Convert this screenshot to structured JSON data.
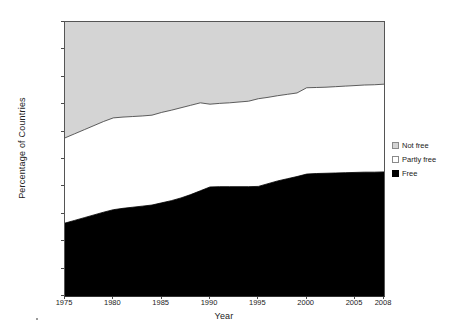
{
  "chart_data": {
    "type": "area",
    "stacked": true,
    "title": "",
    "xlabel": "Year",
    "ylabel": "Percentage of Countries",
    "x": [
      1975,
      1976,
      1977,
      1978,
      1979,
      1980,
      1981,
      1982,
      1983,
      1984,
      1985,
      1986,
      1987,
      1988,
      1989,
      1990,
      1991,
      1992,
      1993,
      1994,
      1995,
      1996,
      1997,
      1998,
      1999,
      2000,
      2001,
      2002,
      2003,
      2004,
      2005,
      2006,
      2007,
      2008
    ],
    "xlim": [
      1975,
      2008
    ],
    "ylim": [
      0,
      100
    ],
    "xticks": [
      1975,
      1980,
      1985,
      1990,
      1995,
      2000,
      2005,
      2008
    ],
    "xtick_labels": [
      "1975",
      "1980",
      "1985",
      "1990",
      "1995",
      "2000",
      "2005",
      "2008"
    ],
    "yticks": [
      0,
      10,
      20,
      30,
      40,
      50,
      60,
      70,
      80,
      90,
      100
    ],
    "ytick_labels": [
      "0%",
      "10%",
      "20%",
      "30%",
      "40%",
      "50%",
      "60%",
      "70%",
      "80%",
      "90%",
      "100%"
    ],
    "grid": false,
    "legend_position": "right",
    "series": [
      {
        "name": "Free",
        "color": "#000000",
        "values": [
          26.6,
          27.6,
          28.6,
          29.6,
          30.6,
          31.5,
          32.0,
          32.4,
          32.8,
          33.2,
          34.0,
          34.8,
          35.8,
          37.0,
          38.4,
          39.8,
          39.9,
          39.9,
          39.9,
          39.9,
          40.0,
          41.0,
          42.0,
          42.8,
          43.6,
          44.5,
          44.7,
          44.8,
          44.9,
          45.0,
          45.1,
          45.2,
          45.2,
          45.3
        ]
      },
      {
        "name": "Partly free",
        "color": "#ffffff",
        "values": [
          31.1,
          31.6,
          32.1,
          32.6,
          33.1,
          33.5,
          33.3,
          33.1,
          32.9,
          32.8,
          33.0,
          33.0,
          32.9,
          32.6,
          32.1,
          30.2,
          30.4,
          30.6,
          30.9,
          31.2,
          32.0,
          31.5,
          31.1,
          30.8,
          30.5,
          31.5,
          31.4,
          31.4,
          31.5,
          31.6,
          31.7,
          31.8,
          31.9,
          32.0
        ]
      },
      {
        "name": "Not free",
        "color": "#d4d4d4",
        "values": [
          42.3,
          40.8,
          39.3,
          37.8,
          36.3,
          35.0,
          34.7,
          34.5,
          34.3,
          34.0,
          33.0,
          32.2,
          31.3,
          30.4,
          29.5,
          30.0,
          29.7,
          29.5,
          29.2,
          28.9,
          28.0,
          27.5,
          26.9,
          26.4,
          25.9,
          24.0,
          23.9,
          23.8,
          23.6,
          23.4,
          23.2,
          23.0,
          22.9,
          22.7
        ]
      }
    ],
    "cumulative_upper": {
      "free": [
        26.6,
        27.6,
        28.6,
        29.6,
        30.6,
        31.5,
        32.0,
        32.4,
        32.8,
        33.2,
        34.0,
        34.8,
        35.8,
        37.0,
        38.4,
        39.8,
        39.9,
        39.9,
        39.9,
        39.9,
        40.0,
        41.0,
        42.0,
        42.8,
        43.6,
        44.5,
        44.7,
        44.8,
        44.9,
        45.0,
        45.1,
        45.2,
        45.2,
        45.3
      ],
      "free_plus_partly": [
        57.7,
        59.2,
        60.7,
        62.2,
        63.7,
        65.0,
        65.3,
        65.5,
        65.7,
        66.0,
        67.0,
        67.8,
        68.7,
        69.6,
        70.5,
        70.0,
        70.3,
        70.5,
        70.8,
        71.1,
        72.0,
        72.5,
        73.1,
        73.6,
        74.1,
        76.0,
        76.1,
        76.2,
        76.4,
        76.6,
        76.8,
        77.0,
        77.1,
        77.3
      ]
    },
    "legend_entries": [
      {
        "label": "Not free",
        "swatch": "light-gray"
      },
      {
        "label": "Partly free",
        "swatch": "white"
      },
      {
        "label": "Free",
        "swatch": "black"
      }
    ],
    "colors": {
      "not_free": "#d4d4d4",
      "partly_free": "#ffffff",
      "free": "#000000",
      "axis": "#555555",
      "text": "#222222"
    }
  }
}
